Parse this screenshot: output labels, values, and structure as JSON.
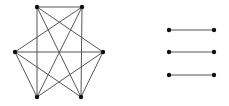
{
  "diagram": {
    "left_graph": {
      "nodes": [
        "top-left",
        "top-right",
        "left",
        "right",
        "bottom-left",
        "bottom-right"
      ],
      "edges": [
        [
          "top-left",
          "top-right"
        ],
        [
          "top-left",
          "bottom-left"
        ],
        [
          "top-right",
          "bottom-right"
        ],
        [
          "top-left",
          "bottom-right"
        ],
        [
          "top-right",
          "bottom-left"
        ],
        [
          "top-left",
          "right"
        ],
        [
          "top-right",
          "left"
        ],
        [
          "left",
          "right"
        ],
        [
          "left",
          "bottom-left"
        ],
        [
          "left",
          "bottom-right"
        ],
        [
          "right",
          "bottom-left"
        ],
        [
          "right",
          "bottom-right"
        ]
      ]
    },
    "right_graph": {
      "edges": [
        [
          "a1",
          "b1"
        ],
        [
          "a2",
          "b2"
        ],
        [
          "a3",
          "b3"
        ]
      ]
    }
  }
}
